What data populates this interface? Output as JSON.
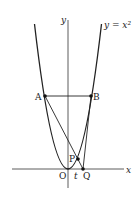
{
  "diagram": {
    "curve_label": "y = x²",
    "axis_x_label": "x",
    "axis_y_label": "y",
    "points": {
      "A": "A",
      "B": "B",
      "O": "O",
      "P": "P",
      "Q": "Q",
      "t": "t"
    },
    "colors": {
      "stroke": "#222222",
      "background": "#ffffff"
    }
  }
}
